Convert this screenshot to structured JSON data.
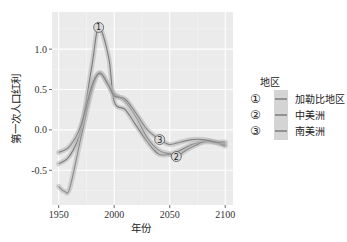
{
  "chart_data": {
    "type": "line",
    "title": "",
    "xlabel": "年份",
    "ylabel": "第一次人口红利",
    "xlim": [
      1944,
      2107
    ],
    "ylim": [
      -0.93,
      1.46
    ],
    "x_ticks": [
      1950,
      2000,
      2050,
      2100
    ],
    "x_tick_labels": [
      "1950",
      "2000",
      "2050",
      "2100"
    ],
    "y_ticks": [
      -0.5,
      0.0,
      0.5,
      1.0
    ],
    "y_tick_labels": [
      "-0.5",
      "0.0",
      "0.5",
      "1.0"
    ],
    "grid": true,
    "background": "#ebebeb",
    "legend": {
      "title": "地区",
      "position": "right"
    },
    "series": [
      {
        "name": "加勒比地区",
        "marker_label": "1",
        "color": "#7a7a7a",
        "label_at": [
          1986,
          1.27
        ],
        "x": [
          1950,
          1960,
          1970,
          1980,
          1986,
          1995,
          2000,
          2010,
          2020,
          2030,
          2040,
          2050,
          2060,
          2070,
          2080,
          2090,
          2100
        ],
        "values": [
          -0.42,
          -0.32,
          0.0,
          0.8,
          1.27,
          0.9,
          0.35,
          0.25,
          0.05,
          -0.15,
          -0.3,
          -0.3,
          -0.25,
          -0.18,
          -0.15,
          -0.15,
          -0.18
        ]
      },
      {
        "name": "中美洲",
        "marker_label": "2",
        "color": "#8a8a8a",
        "label_at": [
          2056,
          -0.33
        ],
        "x": [
          1950,
          1955,
          1960,
          1970,
          1980,
          1987,
          1995,
          2000,
          2010,
          2020,
          2030,
          2040,
          2050,
          2056,
          2065,
          2075,
          2085,
          2100
        ],
        "values": [
          -0.7,
          -0.76,
          -0.72,
          -0.1,
          0.5,
          0.71,
          0.55,
          0.45,
          0.35,
          0.15,
          -0.1,
          -0.25,
          -0.3,
          -0.33,
          -0.25,
          -0.18,
          -0.13,
          -0.2
        ]
      },
      {
        "name": "南美洲",
        "marker_label": "3",
        "color": "#858585",
        "label_at": [
          2041,
          -0.12
        ],
        "x": [
          1950,
          1960,
          1970,
          1980,
          1987,
          1995,
          2000,
          2010,
          2020,
          2030,
          2041,
          2050,
          2060,
          2070,
          2080,
          2090,
          2100
        ],
        "values": [
          -0.28,
          -0.2,
          0.05,
          0.55,
          0.7,
          0.55,
          0.42,
          0.38,
          0.2,
          0.0,
          -0.12,
          -0.18,
          -0.15,
          -0.12,
          -0.12,
          -0.15,
          -0.15
        ]
      }
    ]
  }
}
